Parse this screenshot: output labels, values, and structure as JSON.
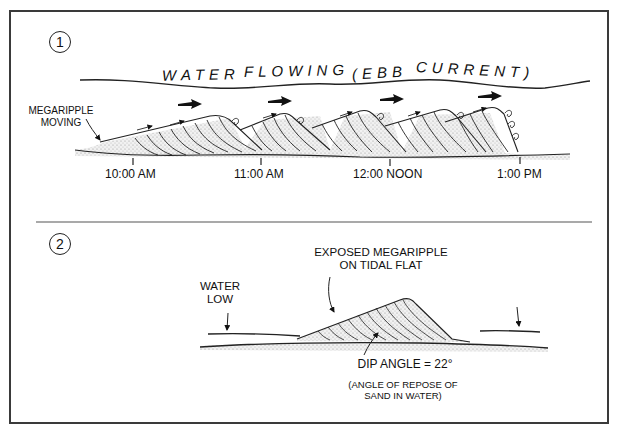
{
  "panels": [
    {
      "number": "1",
      "flow_label": {
        "words": [
          "WATER",
          "FLOWING",
          "(EBB",
          "CURRENT)"
        ],
        "full": "WATER FLOWING (EBB CURRENT)"
      },
      "callout": "MEGARIPPLE\nMOVING",
      "callout_lines": [
        "MEGARIPPLE",
        "MOVING"
      ],
      "time_marks": [
        "10:00 AM",
        "11:00 AM",
        "12:00 NOON",
        "1:00 PM"
      ],
      "flow_arrow_icon": "right-arrow-icon",
      "eddy_icon": "curl-eddy-icon"
    },
    {
      "number": "2",
      "water_label_lines": [
        "WATER",
        "LOW"
      ],
      "megaripple_label_lines": [
        "EXPOSED MEGARIPPLE",
        "ON TIDAL FLAT"
      ],
      "dip_angle_label": "DIP ANGLE = 22°",
      "repose_note_lines": [
        "(ANGLE OF REPOSE OF",
        "SAND IN WATER)"
      ]
    }
  ],
  "colors": {
    "ink": "#111111",
    "frame": "#3a3a3a",
    "sand": "#cfcfcf",
    "background": "#ffffff"
  }
}
